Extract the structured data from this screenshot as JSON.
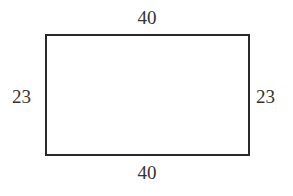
{
  "diagram": {
    "shape": "rectangle",
    "labels": {
      "top": "40",
      "bottom": "40",
      "left": "23",
      "right": "23"
    },
    "stroke_color": "#2a2a2a",
    "text_color": "#333333"
  }
}
